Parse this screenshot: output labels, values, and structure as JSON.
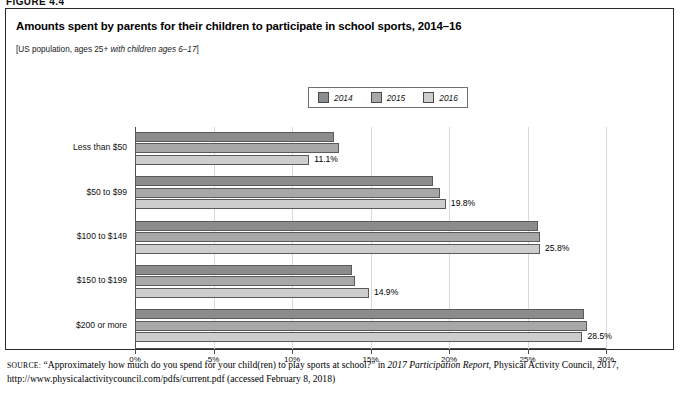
{
  "figure_label": "FIGURE 4.4",
  "chart": {
    "title": "Amounts spent by parents for their children to participate in school sports, 2014–16",
    "subtitle_plain": "[US population, ages 25+ ",
    "subtitle_italic": "with children ages 6–17",
    "subtitle_close": "]"
  },
  "legend": {
    "items": [
      {
        "label": "2014",
        "color": "#8c8c8c"
      },
      {
        "label": "2015",
        "color": "#a8a8a8"
      },
      {
        "label": "2016",
        "color": "#cdcdcd"
      }
    ]
  },
  "source": {
    "prefix": "SOURCE:",
    "line1_a": " “Approximately how much do you spend for your child(ren) to play sports at school?” in ",
    "line1_italic": "2017 Participation Report",
    "line1_b": ", Physical Activity Council, 2017, http://www.physicalactivitycouncil.com/pdfs/current.pdf (accessed February 8, 2018)"
  },
  "chart_data": {
    "type": "bar",
    "orientation": "horizontal",
    "title": "Amounts spent by parents for their children to participate in school sports, 2014–16",
    "subtitle": "[US population, ages 25+ with children ages 6–17]",
    "xlabel": "",
    "ylabel": "",
    "xlim": [
      0,
      30
    ],
    "xticks": [
      0,
      5,
      10,
      15,
      20,
      25,
      30
    ],
    "xtick_labels": [
      "0%",
      "5%",
      "10%",
      "15%",
      "20%",
      "25%",
      "30%"
    ],
    "grid": true,
    "legend_position": "top-center",
    "categories": [
      "Less than $50",
      "$50 to $99",
      "$100 to $149",
      "$150 to $199",
      "$200 or more"
    ],
    "series": [
      {
        "name": "2014",
        "color": "#8c8c8c",
        "values": [
          12.7,
          19.0,
          25.7,
          13.8,
          28.6
        ],
        "labels": [
          "",
          "",
          "",
          "",
          ""
        ]
      },
      {
        "name": "2015",
        "color": "#a8a8a8",
        "values": [
          13.0,
          19.4,
          25.8,
          14.0,
          28.8
        ],
        "labels": [
          "",
          "",
          "",
          "",
          ""
        ]
      },
      {
        "name": "2016",
        "color": "#cdcdcd",
        "values": [
          11.1,
          19.8,
          25.8,
          14.9,
          28.5
        ],
        "labels": [
          "11.1%",
          "19.8%",
          "25.8%",
          "14.9%",
          "28.5%"
        ]
      }
    ]
  }
}
